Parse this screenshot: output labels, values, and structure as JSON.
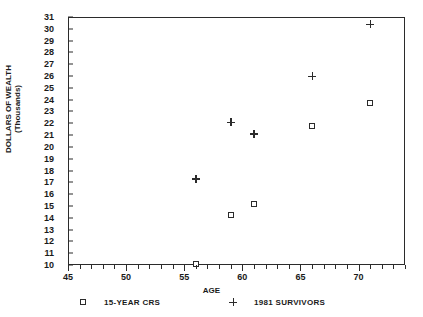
{
  "chart_data": {
    "type": "scatter",
    "title": "",
    "xlabel": "AGE",
    "ylabel": "DOLLARS OF WEALTH\n(Thousands)",
    "xlim": [
      45,
      74
    ],
    "ylim": [
      10,
      31
    ],
    "grid": false,
    "legend_position": "bottom",
    "x_tick_labels": [
      "45",
      "50",
      "55",
      "60",
      "65",
      "70"
    ],
    "x_tick_values": [
      45,
      50,
      55,
      60,
      65,
      70
    ],
    "x_minor_step": 1,
    "y_tick_labels": [
      "10",
      "11",
      "12",
      "13",
      "14",
      "15",
      "16",
      "17",
      "18",
      "19",
      "20",
      "21",
      "22",
      "23",
      "24",
      "25",
      "26",
      "27",
      "28",
      "29",
      "30",
      "31"
    ],
    "y_tick_values": [
      10,
      11,
      12,
      13,
      14,
      15,
      16,
      17,
      18,
      19,
      20,
      21,
      22,
      23,
      24,
      25,
      26,
      27,
      28,
      29,
      30,
      31
    ],
    "series": [
      {
        "name": "15-YEAR CRS",
        "marker": "square",
        "color": "#2b2b2b",
        "x": [
          56,
          59,
          61,
          66,
          71
        ],
        "y": [
          10.1,
          14.2,
          15.2,
          21.8,
          23.7
        ]
      },
      {
        "name": "1981 SURVIVORS",
        "marker": "plus",
        "color": "#2b2b2b",
        "x": [
          56,
          59,
          61,
          66,
          71
        ],
        "y": [
          17.3,
          22.1,
          21.1,
          26.0,
          30.4
        ]
      }
    ]
  },
  "legend": {
    "entries": [
      {
        "label": "15-YEAR CRS",
        "marker": "square"
      },
      {
        "label": "1981 SURVIVORS",
        "marker": "plus"
      }
    ]
  },
  "axes": {
    "x_title": "AGE",
    "y_title": "DOLLARS OF WEALTH\n(Thousands)"
  }
}
